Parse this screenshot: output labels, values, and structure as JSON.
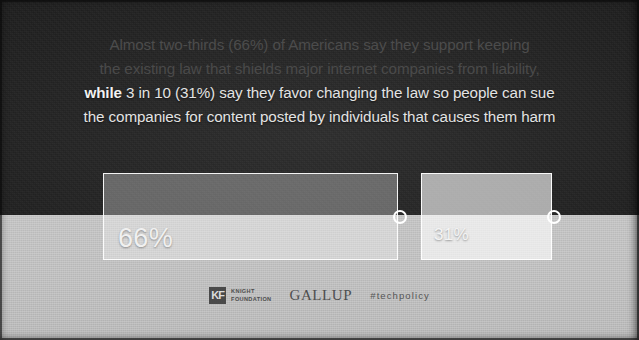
{
  "headline": {
    "line1": "Almost two-thirds (66%) of Americans say they support keeping",
    "line2": "the existing law that shields major internet companies from liability,",
    "line3_bold": "while",
    "line3_rest": " 3 in 10 (31%) say they favor changing the law so people can sue",
    "line4": "the companies for content posted by individuals that causes them harm"
  },
  "footer": {
    "knight_mark": "KF",
    "knight_line1": "KNIGHT",
    "knight_line2": "FOUNDATION",
    "gallup": "GALLUP",
    "hashtag": "#techpolicy"
  },
  "colors": {
    "background_dark": "#232323",
    "background_light": "#bdbdbd",
    "bar_stroke": "#ffffff",
    "text_bright": "#e3e3e3",
    "text_dim": "#4c4c4c"
  },
  "chart_data": {
    "type": "bar",
    "orientation": "horizontal",
    "categories": [
      "Support keeping the existing law",
      "Favor changing the law"
    ],
    "values": [
      66,
      31
    ],
    "value_labels": [
      "66%",
      "31%"
    ],
    "xlabel": "",
    "ylabel": "",
    "ylim": [
      0,
      100
    ],
    "grid": false,
    "legend": "none",
    "source": "Knight Foundation / GALLUP"
  }
}
